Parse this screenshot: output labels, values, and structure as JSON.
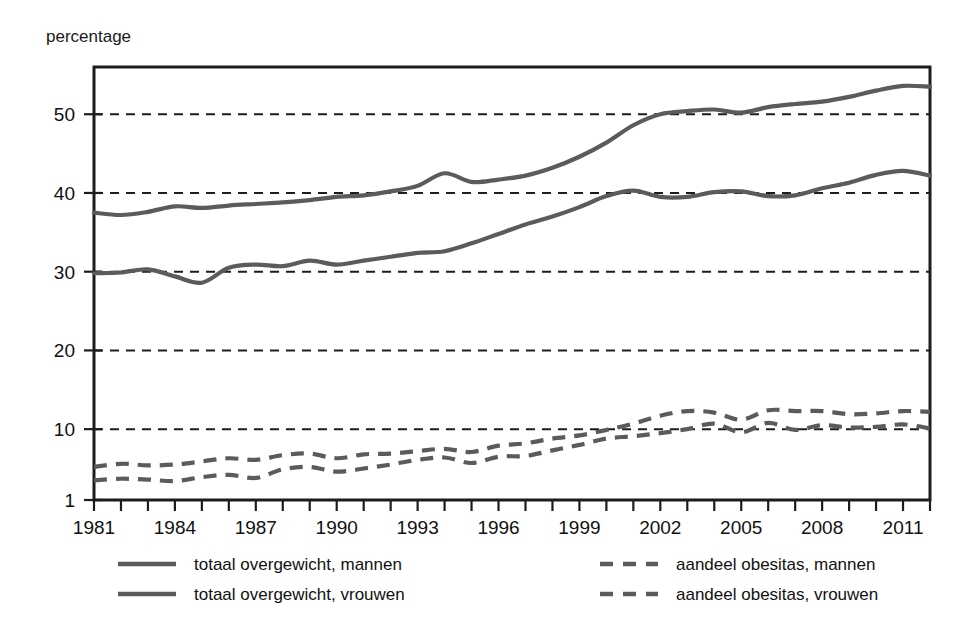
{
  "chart_data": {
    "type": "line",
    "title": "",
    "ylabel": "percentage",
    "xlabel": "",
    "ylim": [
      1,
      56
    ],
    "xlim": [
      1981,
      2012
    ],
    "grid": true,
    "yticks": [
      10,
      20,
      30,
      40,
      50
    ],
    "ytick_labels": [
      "10",
      "20",
      "30",
      "40",
      "50"
    ],
    "y_axis_min_label": "1",
    "xticks": [
      1981,
      1984,
      1987,
      1990,
      1993,
      1996,
      1999,
      2002,
      2005,
      2008,
      2011
    ],
    "xtick_labels": [
      "1981",
      "1984",
      "1987",
      "1990",
      "1993",
      "1996",
      "1999",
      "2002",
      "2005",
      "2008",
      "2011"
    ],
    "x": [
      1981,
      1982,
      1983,
      1984,
      1985,
      1986,
      1987,
      1988,
      1989,
      1990,
      1991,
      1992,
      1993,
      1994,
      1995,
      1996,
      1997,
      1998,
      1999,
      2000,
      2001,
      2002,
      2003,
      2004,
      2005,
      2006,
      2007,
      2008,
      2009,
      2010,
      2011,
      2012
    ],
    "legend_position": "below",
    "series": [
      {
        "name": "totaal overgewicht, mannen",
        "style": "solid",
        "color": "#5b5b5b",
        "values": [
          37.5,
          37.2,
          37.6,
          38.3,
          38.1,
          38.4,
          38.6,
          38.8,
          39.1,
          39.5,
          39.7,
          40.2,
          40.9,
          42.5,
          41.4,
          41.7,
          42.2,
          43.2,
          44.6,
          46.4,
          48.6,
          50.0,
          50.4,
          50.6,
          50.2,
          50.9,
          51.3,
          51.6,
          52.2,
          53.0,
          53.6,
          53.5
        ]
      },
      {
        "name": "totaal overgewicht, vrouwen",
        "style": "solid",
        "color": "#5b5b5b",
        "values": [
          29.8,
          29.9,
          30.3,
          29.4,
          28.6,
          30.5,
          30.9,
          30.7,
          31.4,
          30.9,
          31.4,
          31.9,
          32.4,
          32.6,
          33.6,
          34.8,
          36.0,
          37.0,
          38.2,
          39.6,
          40.3,
          39.5,
          39.5,
          40.1,
          40.2,
          39.6,
          39.7,
          40.6,
          41.3,
          42.3,
          42.8,
          42.2
        ]
      },
      {
        "name": "aandeel obesitas, mannen",
        "style": "dashed",
        "color": "#5b5b5b",
        "values": [
          5.2,
          5.6,
          5.4,
          5.5,
          5.9,
          6.3,
          6.1,
          6.7,
          6.9,
          6.3,
          6.8,
          6.9,
          7.2,
          7.5,
          7.1,
          7.9,
          8.2,
          8.8,
          9.2,
          9.9,
          10.7,
          11.7,
          12.3,
          12.1,
          11.2,
          12.4,
          12.3,
          12.3,
          11.9,
          12.0,
          12.3,
          12.2
        ]
      },
      {
        "name": "aandeel obesitas, vrouwen",
        "style": "dashed",
        "color": "#5b5b5b",
        "values": [
          3.5,
          3.7,
          3.6,
          3.4,
          3.9,
          4.2,
          3.8,
          4.9,
          5.2,
          4.6,
          5.0,
          5.5,
          6.1,
          6.4,
          5.7,
          6.5,
          6.6,
          7.3,
          8.0,
          8.8,
          9.1,
          9.5,
          10.0,
          10.7,
          9.6,
          10.8,
          9.9,
          10.5,
          10.2,
          10.3,
          10.6,
          10.1
        ]
      }
    ]
  },
  "legend": {
    "items": [
      {
        "label": "totaal overgewicht, mannen",
        "style": "solid",
        "column": "left"
      },
      {
        "label": "totaal overgewicht, vrouwen",
        "style": "solid",
        "column": "left"
      },
      {
        "label": "aandeel obesitas, mannen",
        "style": "dashed",
        "column": "right"
      },
      {
        "label": "aandeel obesitas, vrouwen",
        "style": "dashed",
        "column": "right"
      }
    ]
  },
  "colors": {
    "line": "#5b5b5b",
    "axis": "#1d1d1d",
    "text": "#111111",
    "background": "#ffffff"
  }
}
